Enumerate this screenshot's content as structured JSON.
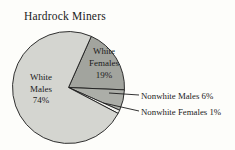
{
  "title": "Hardrock Miners",
  "chart_data": {
    "type": "pie",
    "title": "Hardrock Miners",
    "slices": [
      {
        "id": "white-females",
        "label": "White Females",
        "value_pct": 19,
        "display": "White Females 19%",
        "label_lines": [
          "White",
          "Females",
          "19%"
        ],
        "color": "#a2a49e",
        "label_placement": "inside"
      },
      {
        "id": "nonwhite-males",
        "label": "Nonwhite Males",
        "value_pct": 6,
        "display": "Nonwhite Males 6%",
        "color": "#acaea8",
        "label_placement": "outside-callout"
      },
      {
        "id": "nonwhite-females",
        "label": "Nonwhite Females",
        "value_pct": 1,
        "display": "Nonwhite Females 1%",
        "color": "#f4f4f0",
        "label_placement": "outside-callout"
      },
      {
        "id": "white-males",
        "label": "White Males",
        "value_pct": 74,
        "display": "White Males 74%",
        "label_lines": [
          "White",
          "Males",
          "74%"
        ],
        "color": "#d4d5d0",
        "label_placement": "inside"
      }
    ],
    "layout": {
      "start_angle_deg": 66,
      "direction": "clockwise",
      "stroke_color": "#1c1c1c",
      "legend": "none",
      "grid": false
    }
  }
}
